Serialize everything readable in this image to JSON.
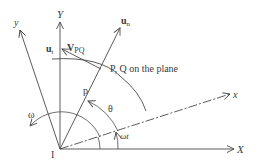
{
  "diagram": {
    "colors": {
      "stroke": "#4a4a4a",
      "text": "#3a3a3a",
      "background": "#ffffff"
    },
    "labels": {
      "X_axis": "X",
      "Y_axis": "Y",
      "x_axis": "x",
      "y_axis": "y",
      "un_base": "u",
      "un_sub": "n",
      "ut_base": "u",
      "ut_sub": "t",
      "vpq_base": "V",
      "vpq_sub": "PQ",
      "plane_point": "P, Q on the plane",
      "p": "p",
      "theta": "θ",
      "omega_t": "ωt",
      "omega": "ω",
      "origin": "I"
    }
  }
}
